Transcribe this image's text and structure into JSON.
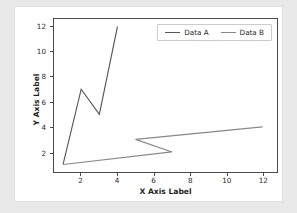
{
  "chart_data": {
    "type": "line",
    "title": "",
    "xlabel": "X Axis Label",
    "ylabel": "Y Axis Label",
    "xlim": [
      0.5,
      12.8
    ],
    "ylim": [
      0.4,
      12.6
    ],
    "xticks": [
      2,
      4,
      6,
      8,
      10,
      12
    ],
    "yticks": [
      2,
      4,
      6,
      8,
      10,
      12
    ],
    "grid": false,
    "legend_position": "upper right",
    "legend_orientation": "horizontal",
    "series": [
      {
        "name": "Data A",
        "color": "#555555",
        "x": [
          1,
          2,
          3,
          4
        ],
        "y": [
          1,
          7,
          5,
          12
        ],
        "points": [
          [
            1,
            1
          ],
          [
            2,
            7
          ],
          [
            3,
            5
          ],
          [
            4,
            12
          ]
        ]
      },
      {
        "name": "Data B",
        "color": "#888888",
        "x": [
          1,
          7,
          5,
          12
        ],
        "y": [
          1,
          2,
          3,
          4
        ],
        "points": [
          [
            1,
            1
          ],
          [
            7,
            2
          ],
          [
            5,
            3
          ],
          [
            12,
            4
          ]
        ]
      }
    ]
  },
  "axes": {
    "x_title": "X Axis Label",
    "y_title": "Y Axis Label",
    "x_tick_labels": [
      "2",
      "4",
      "6",
      "8",
      "10",
      "12"
    ],
    "y_tick_labels": [
      "2",
      "4",
      "6",
      "8",
      "10",
      "12"
    ]
  },
  "legend": {
    "entries": [
      {
        "label": "Data A",
        "color": "#555555"
      },
      {
        "label": "Data B",
        "color": "#888888"
      }
    ]
  },
  "colors": {
    "series_a": "#555555",
    "series_b": "#888888",
    "frame": "#4a4a4a",
    "page_background": "#e9e9e9",
    "card_background": "#ffffff"
  }
}
